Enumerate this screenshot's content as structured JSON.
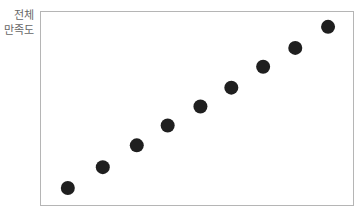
{
  "chart_data": {
    "type": "scatter",
    "title": "",
    "xlabel": "",
    "ylabel": "전체 만족도",
    "ylabel_lines": [
      "전체",
      "만족도"
    ],
    "xlim": [
      0,
      10
    ],
    "ylim": [
      0,
      10
    ],
    "grid": false,
    "legend": null,
    "point_color": "#1f1f1f",
    "frame_color": "#b5b5b5",
    "series": [
      {
        "name": "전체 만족도",
        "x": [
          0.86,
          1.98,
          3.07,
          4.06,
          5.11,
          6.1,
          7.12,
          8.15,
          9.2
        ],
        "y": [
          0.88,
          1.96,
          3.09,
          4.12,
          5.1,
          6.08,
          7.16,
          8.14,
          9.23
        ]
      }
    ]
  }
}
